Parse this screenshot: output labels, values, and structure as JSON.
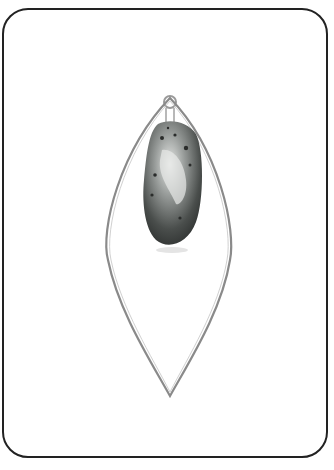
{
  "image": {
    "subject": "Pendant with marquise-shaped wire hoop and speckled teardrop gemstone",
    "caption": "",
    "colors": {
      "background": "#ffffff",
      "card_border": "#222222",
      "wire": "#8a8a8a",
      "stone_dark": "#3a3d3c",
      "stone_light": "#d8dad8"
    }
  }
}
